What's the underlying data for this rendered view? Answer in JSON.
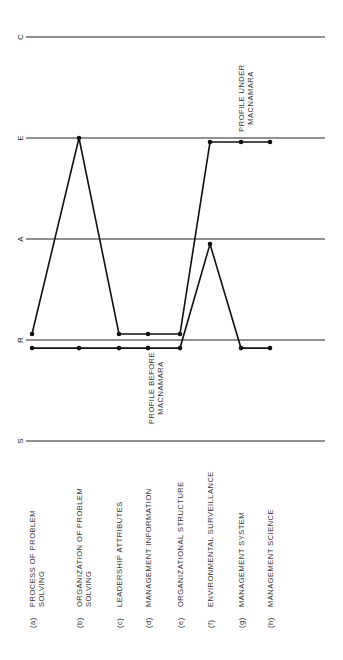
{
  "chart_data": {
    "type": "line",
    "orientation": "rotated-90-ccw",
    "title": "",
    "xlabel": "",
    "ylabel": "",
    "levels": [
      {
        "key": "S",
        "label": "S",
        "value": 0
      },
      {
        "key": "R",
        "label": "R",
        "value": 1
      },
      {
        "key": "A",
        "label": "A",
        "value": 2
      },
      {
        "key": "E",
        "label": "E",
        "value": 3
      },
      {
        "key": "C",
        "label": "C",
        "value": 4
      }
    ],
    "ylim": [
      0,
      4
    ],
    "grid": true,
    "categories": [
      {
        "id": "(a)",
        "lines": [
          "PROCESS OF PROBLEM",
          "SOLVING"
        ]
      },
      {
        "id": "(b)",
        "lines": [
          "ORGANIZATION OF PROBLEM",
          "SOLVING"
        ]
      },
      {
        "id": "(c)",
        "lines": [
          "LEADERSHIP ATTRIBUTES"
        ]
      },
      {
        "id": "(d)",
        "lines": [
          "MANAGEMENT INFORMATION"
        ]
      },
      {
        "id": "(e)",
        "lines": [
          "ORGANIZATIONAL STRUCTURE"
        ]
      },
      {
        "id": "(f)",
        "lines": [
          "ENVIRONMENTAL SURVEILLANCE"
        ]
      },
      {
        "id": "(g)",
        "lines": [
          "MANAGEMENT SYSTEM"
        ]
      },
      {
        "id": "(h)",
        "lines": [
          "MANAGEMENT SCIENCE"
        ]
      }
    ],
    "series": [
      {
        "name": "PROFILE UNDER MACNAMARA",
        "label_lines": [
          "PROFILE UNDER",
          "MACNAMARA"
        ],
        "values": [
          1.06,
          3.0,
          1.06,
          1.06,
          1.06,
          2.96,
          2.96,
          2.96
        ]
      },
      {
        "name": "PROFILE BEFORE MACNAMARA",
        "label_lines": [
          "PROFILE BEFORE",
          "MACNAMARA"
        ],
        "values": [
          0.92,
          0.92,
          0.92,
          0.92,
          0.92,
          1.95,
          0.92,
          0.92
        ]
      }
    ]
  },
  "layout": {
    "cat_x": [
      32,
      79,
      119,
      148,
      180,
      210,
      241,
      270
    ],
    "level_y0": 441,
    "level_step": 101,
    "line_x0": 30,
    "line_x1": 325
  }
}
